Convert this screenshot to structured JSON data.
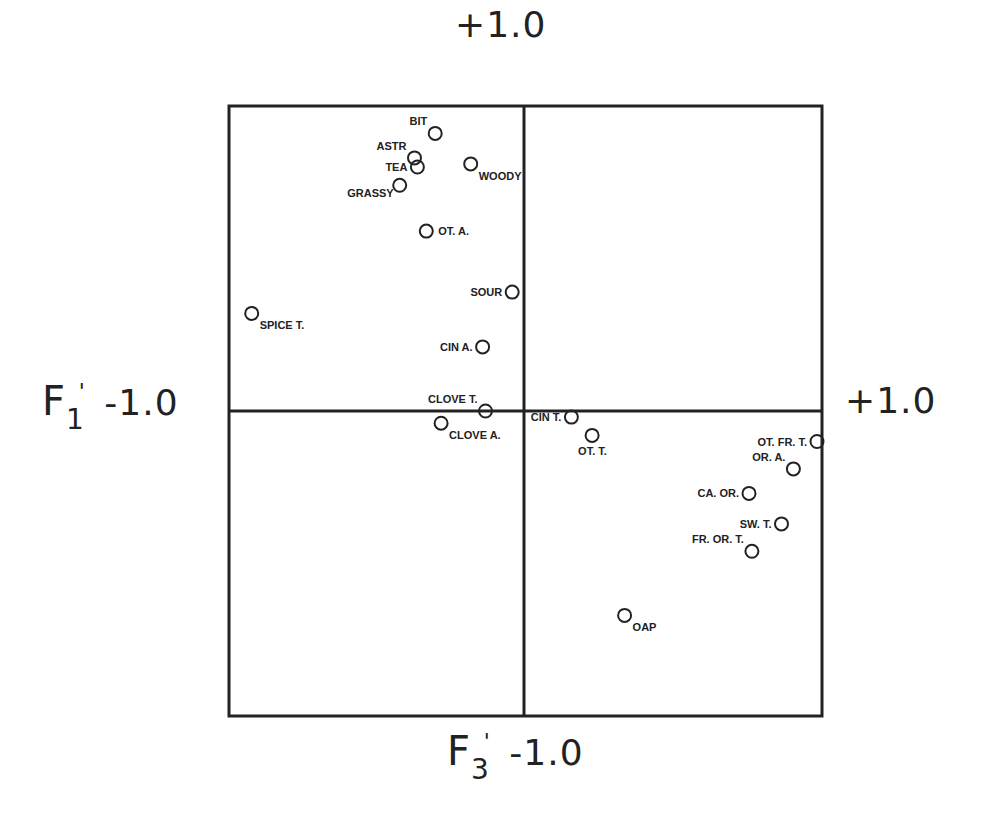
{
  "chart_data": {
    "type": "scatter",
    "title": "",
    "xlabel": "F3'",
    "ylabel": "F1'",
    "xlim": [
      -1.0,
      1.0
    ],
    "ylim": [
      -1.0,
      1.0
    ],
    "grid": false,
    "legend": null,
    "axis_tick_labels": {
      "top": "+1.0",
      "bottom": "-1.0",
      "left": "-1.0",
      "right": "+1.0"
    },
    "points": [
      {
        "label": "BIT",
        "x": -0.3,
        "y": 0.91,
        "label_pos": "upper-left"
      },
      {
        "label": "ASTR",
        "x": -0.37,
        "y": 0.83,
        "label_pos": "upper-left"
      },
      {
        "label": "TEA",
        "x": -0.36,
        "y": 0.8,
        "label_pos": "left"
      },
      {
        "label": "WOODY",
        "x": -0.18,
        "y": 0.81,
        "label_pos": "lower-right"
      },
      {
        "label": "GRASSY",
        "x": -0.42,
        "y": 0.74,
        "label_pos": "lower-left"
      },
      {
        "label": "OT. A.",
        "x": -0.33,
        "y": 0.59,
        "label_pos": "right"
      },
      {
        "label": "SOUR",
        "x": -0.04,
        "y": 0.39,
        "label_pos": "left"
      },
      {
        "label": "SPICE T.",
        "x": -0.92,
        "y": 0.32,
        "label_pos": "lower-right"
      },
      {
        "label": "CIN A.",
        "x": -0.14,
        "y": 0.21,
        "label_pos": "left"
      },
      {
        "label": "CLOVE T.",
        "x": -0.13,
        "y": 0.0,
        "label_pos": "upper-left"
      },
      {
        "label": "CLOVE A.",
        "x": -0.28,
        "y": -0.04,
        "label_pos": "lower-right"
      },
      {
        "label": "CIN T.",
        "x": 0.16,
        "y": -0.02,
        "label_pos": "left"
      },
      {
        "label": "OT. T.",
        "x": 0.23,
        "y": -0.08,
        "label_pos": "below"
      },
      {
        "label": "OT. FR. T.",
        "x": 0.99,
        "y": -0.1,
        "label_pos": "left"
      },
      {
        "label": "OR. A.",
        "x": 0.91,
        "y": -0.19,
        "label_pos": "upper-left"
      },
      {
        "label": "CA. OR.",
        "x": 0.76,
        "y": -0.27,
        "label_pos": "left"
      },
      {
        "label": "SW. T.",
        "x": 0.87,
        "y": -0.37,
        "label_pos": "left"
      },
      {
        "label": "FR. OR. T.",
        "x": 0.77,
        "y": -0.46,
        "label_pos": "upper-left"
      },
      {
        "label": "OAP",
        "x": 0.34,
        "y": -0.67,
        "label_pos": "lower-right"
      }
    ]
  },
  "axes": {
    "top_label": "+1.0",
    "bottom_label": "-1.0",
    "left_label": "-1.0",
    "right_label": "+1.0",
    "x_factor": "F",
    "x_factor_sub": "3",
    "y_factor": "F",
    "y_factor_sub": "1",
    "prime": "'"
  },
  "style": {
    "line_color": "#222222",
    "marker_color": "#222222",
    "background": "#ffffff"
  }
}
